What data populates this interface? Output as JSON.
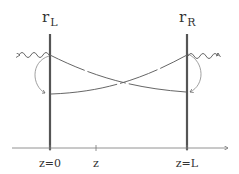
{
  "diagram": {
    "mirrors": {
      "left": {
        "label": "r",
        "subscript": "L"
      },
      "right": {
        "label": "r",
        "subscript": "R"
      }
    },
    "axis": {
      "ticks": [
        {
          "label": "z=0"
        },
        {
          "label": "z"
        },
        {
          "label": "z=L"
        }
      ]
    },
    "colors": {
      "mirror": "#555555",
      "beam": "#666666",
      "axis": "#777777",
      "text": "#333333"
    }
  }
}
